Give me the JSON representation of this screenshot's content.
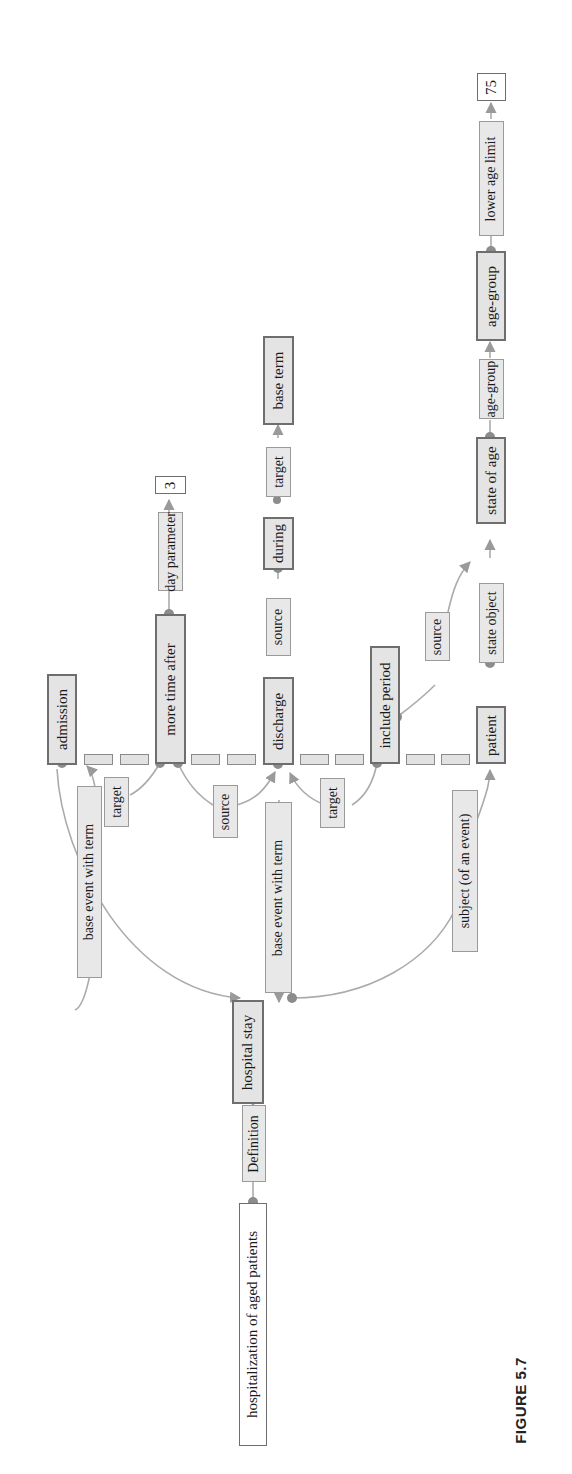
{
  "figure": {
    "caption": "FIGURE 5.7",
    "orientation": "rotated 90 degrees counter-clockwise"
  },
  "colors": {
    "line": "#a8a8a8",
    "dot": "#8c8c8c",
    "concept_fill": "#e4e4e4",
    "concept_border": "#6e6e6e",
    "relation_fill": "#e8e8e8"
  },
  "nodes": {
    "root": "hospitalization of aged patients",
    "definition": "Definition",
    "hospital_stay": "hospital stay",
    "base_event_with_term_1": "base event with term",
    "base_event_with_term_2": "base event with term",
    "subject_of_event": "subject (of an event)",
    "admission": "admission",
    "target_1": "target",
    "more_time_after": "more time after",
    "day_parameter": "day parameter",
    "value_3": "3",
    "source_1": "source",
    "discharge": "discharge",
    "source_2": "source",
    "during": "during",
    "target_2": "target",
    "base_term": "base term",
    "target_3": "target",
    "include_period": "include period",
    "source_3": "source",
    "patient": "patient",
    "state_object": "state object",
    "state_of_age": "state of age",
    "age_group_rel": "age-group",
    "age_group": "age-group",
    "lower_age_limit": "lower age limit",
    "value_75": "75"
  },
  "edges": [
    {
      "from": "hospitalization of aged patients",
      "via": "Definition",
      "to": "hospital stay"
    },
    {
      "from": "hospital stay",
      "via": "base event with term",
      "to": "admission"
    },
    {
      "from": "hospital stay",
      "via": "base event with term",
      "to": "discharge"
    },
    {
      "from": "hospital stay",
      "via": "subject (of an event)",
      "to": "patient"
    },
    {
      "from": "more time after",
      "via": "target",
      "to": "admission"
    },
    {
      "from": "more time after",
      "via": "source",
      "to": "discharge"
    },
    {
      "from": "more time after",
      "via": "day parameter",
      "to": "3"
    },
    {
      "from": "during",
      "via": "source",
      "to": "discharge"
    },
    {
      "from": "during",
      "via": "target",
      "to": "base term"
    },
    {
      "from": "include period",
      "via": "target",
      "to": "discharge"
    },
    {
      "from": "include period",
      "via": "source",
      "to": "state of age"
    },
    {
      "from": "state of age",
      "via": "state object",
      "to": "patient"
    },
    {
      "from": "state of age",
      "via": "age-group",
      "to": "age-group"
    },
    {
      "from": "age-group",
      "via": "lower age limit",
      "to": "75"
    }
  ]
}
